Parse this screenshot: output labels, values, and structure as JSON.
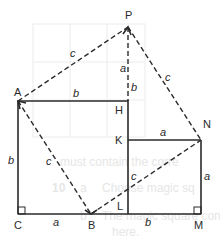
{
  "diagram": {
    "points": {
      "P": "P",
      "A": "A",
      "H": "H",
      "K": "K",
      "N": "N",
      "C": "C",
      "B": "B",
      "L": "L",
      "M": "M"
    },
    "side_labels": {
      "AP": "c",
      "PH_upper": "a",
      "PH_lower": "b",
      "PN": "c",
      "AH": "b",
      "KN": "a",
      "AC": "b",
      "AB": "c",
      "BN": "c",
      "NM": "a",
      "CB": "a",
      "LM": "b"
    },
    "bleed_text": {
      "line1": "must contain the corre",
      "line2_num": "10",
      "line2_a": "a",
      "line2_text": "Choose magic sq",
      "line3_b": "b",
      "line3_text": "The magic square cont",
      "line4": "here."
    },
    "colors": {
      "line": "#2a2a2a",
      "bleed": "#e6e6e6",
      "grid": "#ececec"
    }
  }
}
